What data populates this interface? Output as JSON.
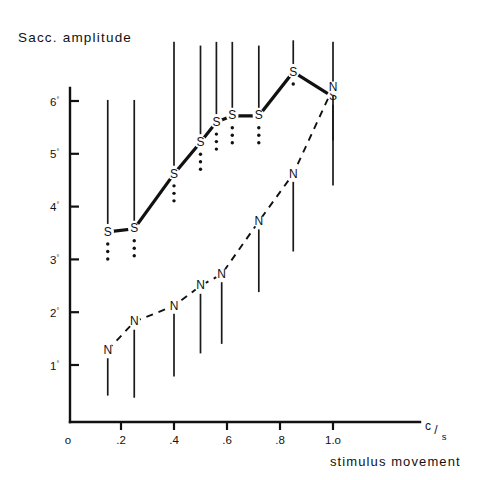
{
  "figure": {
    "title": "Sacc. amplitude",
    "x_axis_title": "stimulus movement",
    "x_unit_numerator": "c",
    "x_unit_slash": "/",
    "x_unit_denominator": "s",
    "origin_label": "o",
    "degree_symbol": "°",
    "ink_color": "#111111"
  },
  "chart_data": {
    "type": "scatter",
    "title": "Sacc. amplitude",
    "xlabel": "stimulus movement",
    "ylabel": "Sacc. amplitude",
    "x_unit": "c/s",
    "y_unit": "degrees",
    "xlim": [
      0,
      1.12
    ],
    "ylim": [
      0,
      6.9
    ],
    "grid": false,
    "legend": "none",
    "x_ticks": [
      0,
      0.2,
      0.4,
      0.6,
      0.8,
      1.0
    ],
    "x_tick_labels": [
      "o",
      ".2",
      ".4",
      ".6",
      ".8",
      "1.o"
    ],
    "y_ticks": [
      1,
      2,
      3,
      4,
      5,
      6
    ],
    "y_tick_labels": [
      "1°",
      "2°",
      "3°",
      "4°",
      "5°",
      "6°"
    ],
    "series": [
      {
        "name": "S",
        "marker_letter": "S",
        "line_style": "solid",
        "x": [
          0.15,
          0.25,
          0.4,
          0.5,
          0.56,
          0.62,
          0.72,
          0.85,
          1.0
        ],
        "y": [
          3.52,
          3.58,
          4.62,
          5.22,
          5.6,
          5.72,
          5.72,
          6.55,
          6.08
        ],
        "error_high": [
          6.02,
          6.02,
          7.12,
          7.05,
          7.12,
          7.12,
          7.05,
          7.15,
          7.12
        ],
        "error_low": [
          3.52,
          3.58,
          4.62,
          5.22,
          5.6,
          5.72,
          5.72,
          6.55,
          5.25
        ],
        "significance_dots": [
          3,
          3,
          3,
          3,
          3,
          3,
          3,
          1,
          0
        ]
      },
      {
        "name": "N",
        "marker_letter": "N",
        "line_style": "dashed",
        "x": [
          0.15,
          0.25,
          0.4,
          0.5,
          0.58,
          0.72,
          0.85,
          1.0
        ],
        "y": [
          1.28,
          1.82,
          2.12,
          2.5,
          2.72,
          3.72,
          4.62,
          6.25
        ],
        "error_high": [
          1.28,
          1.82,
          2.12,
          2.5,
          2.72,
          3.72,
          4.62,
          6.25
        ],
        "error_low": [
          0.42,
          0.38,
          0.78,
          1.22,
          1.4,
          2.38,
          3.15,
          4.4
        ],
        "significance_dots": [
          0,
          0,
          0,
          0,
          0,
          0,
          0,
          0
        ]
      }
    ]
  }
}
